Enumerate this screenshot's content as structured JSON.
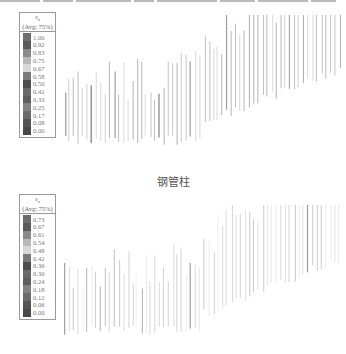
{
  "panels": [
    {
      "id": "top",
      "legend": {
        "symbol": "ε",
        "subscript": "u",
        "avg_label": "(Avg: 75%)",
        "values": [
          "1.00",
          "0.92",
          "0.83",
          "0.75",
          "0.67",
          "0.58",
          "0.50",
          "0.42",
          "0.33",
          "0.25",
          "0.17",
          "0.08",
          "0.00"
        ],
        "swatch_colors": [
          "#6e6e6e",
          "#5a5a5a",
          "#8a8a8a",
          "#b8b8b8",
          "#d8d8d8",
          "#7a7a7a",
          "#4e4e4e",
          "#6a6a6a",
          "#5e5e5e",
          "#828282",
          "#6c6c6c",
          "#545454",
          "#484848"
        ]
      }
    },
    {
      "id": "bottom",
      "legend": {
        "symbol": "ε",
        "subscript": "u",
        "avg_label": "(Avg: 75%)",
        "values": [
          "0.73",
          "0.67",
          "0.61",
          "0.54",
          "0.48",
          "0.42",
          "0.36",
          "0.30",
          "0.24",
          "0.18",
          "0.12",
          "0.06",
          "0.00"
        ],
        "swatch_colors": [
          "#6e6e6e",
          "#5a5a5a",
          "#8a8a8a",
          "#b8b8b8",
          "#d8d8d8",
          "#7a7a7a",
          "#4e4e4e",
          "#6a6a6a",
          "#5e5e5e",
          "#828282",
          "#6c6c6c",
          "#545454",
          "#484848"
        ]
      }
    }
  ],
  "caption": "钢管柱"
}
